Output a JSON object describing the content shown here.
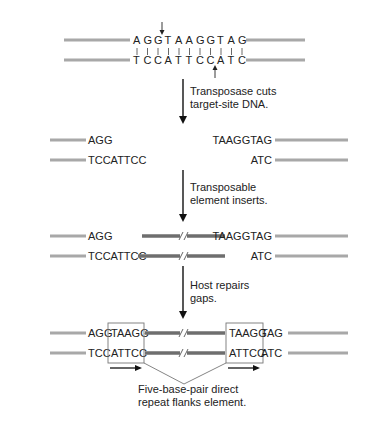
{
  "stage1": {
    "top_strand": [
      "A",
      "G",
      "G",
      "T",
      "A",
      "A",
      "G",
      "G",
      "T",
      "A",
      "G"
    ],
    "bottom_strand": [
      "T",
      "C",
      "C",
      "A",
      "T",
      "T",
      "C",
      "C",
      "A",
      "T",
      "C"
    ],
    "cut_top_after_index": 2,
    "cut_bottom_after_index": 7
  },
  "steps": [
    {
      "line1": "Transposase cuts",
      "line2": "target-site DNA."
    },
    {
      "line1": "Transposable",
      "line2": "element inserts."
    },
    {
      "line1": "Host repairs",
      "line2": "gaps."
    }
  ],
  "stage2": {
    "left_top": "AGG",
    "left_bottom": "TCCATTCC",
    "right_top": "TAAGGTAG",
    "right_bottom": "ATC"
  },
  "stage3": {
    "left_top": "AGG",
    "left_bottom": "TCCATTCC",
    "right_top": "TAAGGTAG",
    "right_bottom": "ATC"
  },
  "stage4": {
    "left_top_plain": "AGG",
    "left_top_boxed": "TAAGG",
    "left_bottom_plain": "TCC",
    "left_bottom_boxed": "ATTCC",
    "right_top_boxed": "TAAGG",
    "right_top_plain": "TAG",
    "right_bottom_boxed": "ATTCC",
    "right_bottom_plain": "ATC"
  },
  "caption": {
    "line1": "Five-base-pair direct",
    "line2": "repeat flanks element."
  },
  "colors": {
    "host_dna": "#a8a8a8",
    "transposon_dna": "#6e6e6e",
    "text": "#222222"
  }
}
